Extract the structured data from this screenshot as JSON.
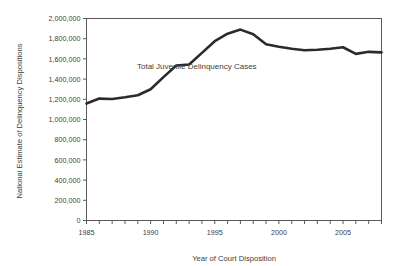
{
  "chart_data": {
    "type": "line",
    "title": "",
    "xlabel": "Year of Court Disposition",
    "ylabel": "National Estimate of Delinquency Dispositions",
    "xlim": [
      1985,
      2008
    ],
    "ylim": [
      0,
      2000000
    ],
    "grid": false,
    "legend_position": "inline-annotation",
    "x_tick_labels": [
      "1985",
      "1990",
      "1995",
      "2000",
      "2005"
    ],
    "x_tick_values": [
      1985,
      1990,
      1995,
      2000,
      2005
    ],
    "x_minor_ticks": [
      1985,
      1986,
      1987,
      1988,
      1989,
      1990,
      1991,
      1992,
      1993,
      1994,
      1995,
      1996,
      1997,
      1998,
      1999,
      2000,
      2001,
      2002,
      2003,
      2004,
      2005,
      2006,
      2007,
      2008
    ],
    "y_tick_labels": [
      "0",
      "200,000",
      "400,000",
      "600,000",
      "800,000",
      "1,000,000",
      "1,200,000",
      "1,400,000",
      "1,600,000",
      "1,800,000",
      "2,000,000"
    ],
    "y_tick_values": [
      0,
      200000,
      400000,
      600000,
      800000,
      1000000,
      1200000,
      1400000,
      1600000,
      1800000,
      2000000
    ],
    "series": [
      {
        "name": "Total Juvenile Delinquency Cases",
        "color": "#2b2b2b",
        "line_width": 2.6,
        "x": [
          1985,
          1986,
          1987,
          1988,
          1989,
          1990,
          1991,
          1992,
          1993,
          1994,
          1995,
          1996,
          1997,
          1998,
          1999,
          2000,
          2001,
          2002,
          2003,
          2004,
          2005,
          2006,
          2007,
          2008
        ],
        "values": [
          1159000,
          1207000,
          1203000,
          1220000,
          1240000,
          1300000,
          1420000,
          1535000,
          1545000,
          1660000,
          1775000,
          1850000,
          1890000,
          1845000,
          1745000,
          1720000,
          1700000,
          1685000,
          1690000,
          1700000,
          1715000,
          1650000,
          1670000,
          1665000
        ]
      }
    ],
    "annotations": [
      {
        "text": "Total Juvenile Delinquency Cases",
        "x": 1993.6,
        "y": 1500000
      }
    ],
    "colors": {
      "line": "#2b2b2b",
      "axis": "#5a5a5a",
      "text": "#404040",
      "background": "#ffffff"
    }
  }
}
